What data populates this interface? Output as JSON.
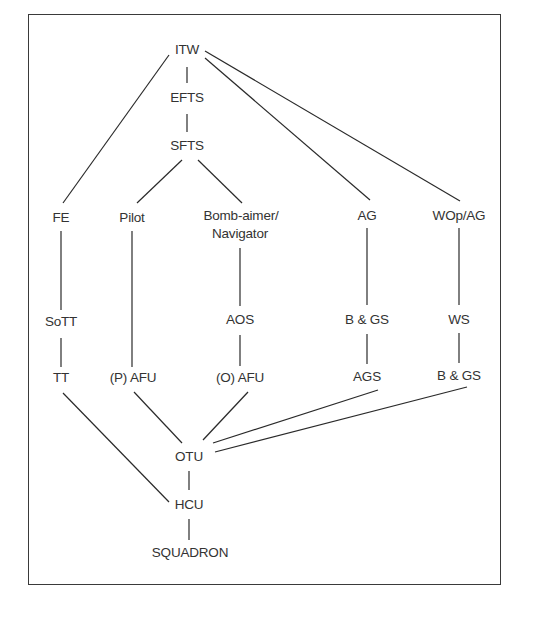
{
  "diagram": {
    "type": "flowchart",
    "nodes": {
      "itw": "ITW",
      "efts": "EFTS",
      "sfts": "SFTS",
      "fe": "FE",
      "pilot": "Pilot",
      "bomb_aimer": "Bomb-aimer/",
      "navigator": "Navigator",
      "ag": "AG",
      "wop_ag": "WOp/AG",
      "sott": "SoTT",
      "aos": "AOS",
      "bgs_ag": "B & GS",
      "ws": "WS",
      "tt": "TT",
      "p_afu": "(P) AFU",
      "o_afu": "(O) AFU",
      "ags": "AGS",
      "bgs_wop": "B & GS",
      "otu": "OTU",
      "hcu": "HCU",
      "squadron": "SQUADRON"
    },
    "edges": [
      [
        "ITW",
        "EFTS"
      ],
      [
        "EFTS",
        "SFTS"
      ],
      [
        "ITW",
        "FE"
      ],
      [
        "ITW",
        "AG"
      ],
      [
        "ITW",
        "WOp/AG"
      ],
      [
        "SFTS",
        "Pilot"
      ],
      [
        "SFTS",
        "Bomb-aimer/Navigator"
      ],
      [
        "FE",
        "SoTT"
      ],
      [
        "SoTT",
        "TT"
      ],
      [
        "Pilot",
        "(P) AFU"
      ],
      [
        "Bomb-aimer/Navigator",
        "AOS"
      ],
      [
        "AOS",
        "(O) AFU"
      ],
      [
        "AG",
        "B & GS"
      ],
      [
        "B & GS",
        "AGS"
      ],
      [
        "WOp/AG",
        "WS"
      ],
      [
        "WS",
        "B & GS"
      ],
      [
        "TT",
        "HCU"
      ],
      [
        "(P) AFU",
        "OTU"
      ],
      [
        "(O) AFU",
        "OTU"
      ],
      [
        "AGS",
        "OTU"
      ],
      [
        "B & GS",
        "OTU"
      ],
      [
        "OTU",
        "HCU"
      ],
      [
        "HCU",
        "SQUADRON"
      ]
    ],
    "colors": {
      "text": "#333333",
      "line": "#2a2a2a",
      "border": "#3a3a3a",
      "background": "#ffffff"
    }
  }
}
